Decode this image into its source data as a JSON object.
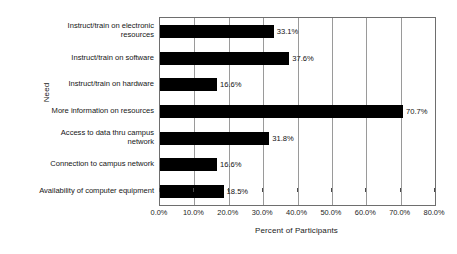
{
  "chart_data": {
    "type": "bar",
    "orientation": "horizontal",
    "title": "",
    "xlabel": "Percent of Participants",
    "ylabel": "Need",
    "xlim": [
      0,
      80
    ],
    "xtick_labels": [
      "0.0%",
      "10.0%",
      "20.0%",
      "30.0%",
      "40.0%",
      "50.0%",
      "60.0%",
      "70.0%",
      "80.0%"
    ],
    "xticks": [
      0,
      10,
      20,
      30,
      40,
      50,
      60,
      70,
      80
    ],
    "grid": "vertical",
    "legend": "none",
    "bar_color": "#000000",
    "categories": [
      "Instruct/train on electronic resources",
      "Instruct/train on software",
      "Instruct/train on hardware",
      "More information on resources",
      "Access to data thru campus network",
      "Connection to campus network",
      "Availability of computer equipment"
    ],
    "values": [
      33.1,
      37.6,
      16.6,
      70.7,
      31.8,
      16.6,
      18.5
    ],
    "value_labels": [
      "33.1%",
      "37.6%",
      "16.6%",
      "70.7%",
      "31.8%",
      "16.6%",
      "18.5%"
    ]
  }
}
